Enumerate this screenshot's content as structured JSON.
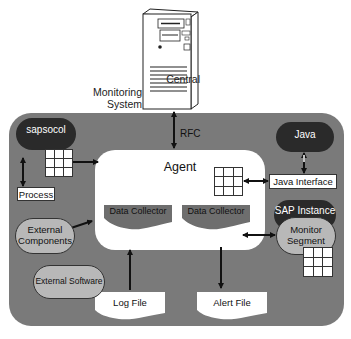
{
  "diagram": {
    "server_label_line1": "Central",
    "server_label_line2": "Monitoring System",
    "rfc_label": "RFC",
    "agent_label": "Agent",
    "data_collector_1": "Data Collector",
    "data_collector_2": "Data Collector",
    "sapsocol_label": "sapsocol",
    "process_label": "Process",
    "java_label": "Java",
    "java_interface_label": "Java Interface",
    "sap_instance_label": "SAP Instance",
    "monitor_segment_line1": "Monitor",
    "monitor_segment_line2": "Segment",
    "external_components_line1": "External",
    "external_components_line2": "Components",
    "external_software_label": "External Software",
    "log_file_label": "Log File",
    "alert_file_label": "Alert File"
  },
  "colors": {
    "panel": "#7a7a7a",
    "dark_node": "#2a2a2a",
    "light_node": "#b8b8b8",
    "collector": "#6e6e6e"
  }
}
